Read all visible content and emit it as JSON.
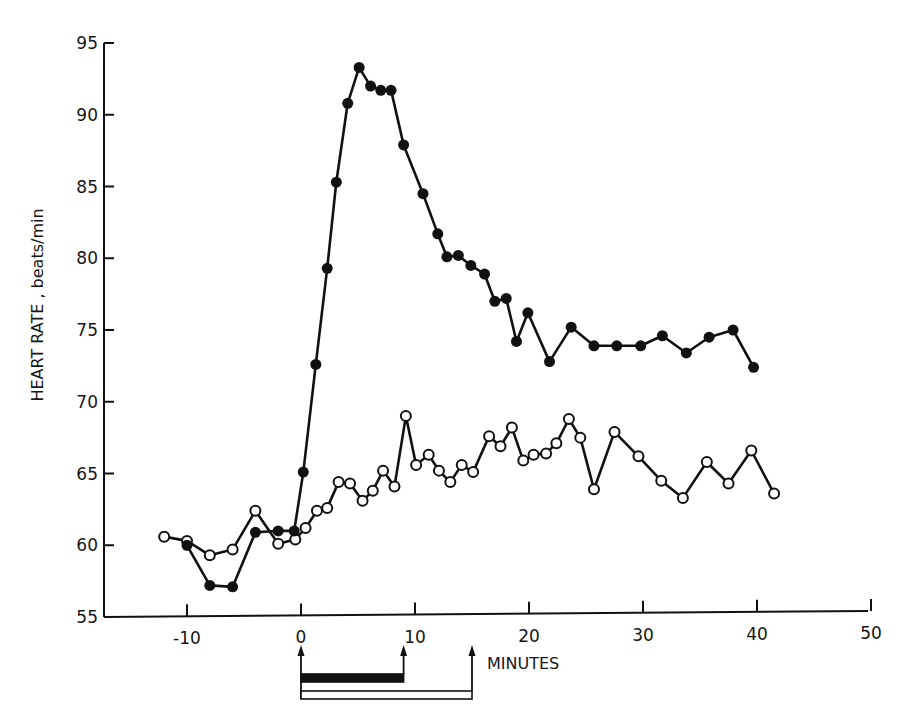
{
  "chart_data": {
    "type": "line",
    "title": "",
    "xlabel": "MINUTES",
    "ylabel": "HEART RATE , beats/min",
    "xlim": [
      -17,
      50
    ],
    "ylim": [
      55,
      95
    ],
    "x_ticks": [
      -10,
      0,
      10,
      20,
      30,
      40,
      50
    ],
    "x_tick_labels": [
      "-10",
      "0",
      "10",
      "20",
      "30",
      "40",
      "50"
    ],
    "y_ticks": [
      55,
      60,
      65,
      70,
      75,
      80,
      85,
      90,
      95
    ],
    "y_tick_labels": [
      "55",
      "60",
      "65",
      "70",
      "75",
      "80",
      "85",
      "90",
      "95"
    ],
    "grid": false,
    "legend": null,
    "series": [
      {
        "name": "filled-circles",
        "marker": "filled",
        "x": [
          -10,
          -8,
          -6,
          -4,
          -2,
          -0.6,
          0.2,
          1.3,
          2.3,
          3.1,
          4.1,
          5.1,
          6.1,
          7.0,
          7.9,
          9.0,
          10.7,
          12.0,
          12.8,
          13.8,
          14.9,
          16.1,
          17.0,
          18.0,
          18.9,
          19.9,
          21.8,
          23.7,
          25.7,
          27.7,
          29.8,
          31.7,
          33.8,
          35.8,
          37.9,
          39.7
        ],
        "values": [
          60.0,
          57.2,
          57.1,
          60.9,
          61.0,
          61.0,
          65.1,
          72.6,
          79.3,
          85.3,
          90.8,
          93.3,
          92.0,
          91.7,
          91.7,
          87.9,
          84.5,
          81.7,
          80.1,
          80.2,
          79.5,
          78.9,
          77.0,
          77.2,
          74.2,
          76.2,
          72.8,
          75.2,
          73.9,
          73.9,
          73.9,
          74.6,
          73.4,
          74.5,
          75.0,
          72.4
        ]
      },
      {
        "name": "open-circles",
        "marker": "open",
        "x": [
          -12,
          -10,
          -8,
          -6,
          -4,
          -2,
          -0.5,
          0.4,
          1.4,
          2.3,
          3.3,
          4.3,
          5.4,
          6.3,
          7.2,
          8.2,
          9.2,
          10.1,
          11.2,
          12.1,
          13.1,
          14.1,
          15.1,
          16.5,
          17.5,
          18.5,
          19.5,
          20.4,
          21.5,
          22.4,
          23.5,
          24.5,
          25.7,
          27.5,
          29.6,
          31.6,
          33.5,
          35.6,
          37.5,
          39.5,
          41.5
        ],
        "values": [
          60.6,
          60.3,
          59.3,
          59.7,
          62.4,
          60.1,
          60.4,
          61.2,
          62.4,
          62.6,
          64.4,
          64.3,
          63.1,
          63.8,
          65.2,
          64.1,
          69.0,
          65.6,
          66.3,
          65.2,
          64.4,
          65.6,
          65.1,
          67.6,
          66.9,
          68.2,
          65.9,
          66.3,
          66.4,
          67.1,
          68.8,
          67.5,
          63.9,
          67.9,
          66.2,
          64.5,
          63.3,
          65.8,
          64.3,
          66.6,
          63.6
        ]
      }
    ],
    "annotations": {
      "arrows_at_minutes": [
        0,
        9,
        15
      ],
      "bars": [
        {
          "name": "filled-bar",
          "fill": "black",
          "start": 0,
          "end": 9
        },
        {
          "name": "open-bar",
          "fill": "white",
          "start": 0,
          "end": 15
        }
      ]
    }
  },
  "layout": {
    "plot_left": 104,
    "plot_right": 868,
    "plot_bottom": 617,
    "x_origin_px": 301,
    "x_px_per_unit": 11.4,
    "y_px_per_unit": 14.35
  },
  "colors": {
    "ink": "#111111",
    "background": "#ffffff"
  }
}
